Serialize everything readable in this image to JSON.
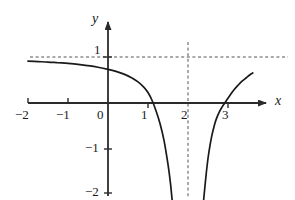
{
  "chart_data": {
    "type": "line",
    "title": "",
    "subtitle": "",
    "xlabel": "x",
    "ylabel": "y",
    "xlim": [
      -2.2,
      3.65
    ],
    "ylim": [
      -2.25,
      1.3
    ],
    "grid": false,
    "legend": null,
    "xticks": [
      -2,
      -1,
      0,
      1,
      2,
      3
    ],
    "xtick_labels": [
      "−2",
      "−1",
      "0",
      "1",
      "2",
      "3"
    ],
    "yticks": [
      1,
      -1,
      -2
    ],
    "ytick_labels": [
      "1",
      "−1",
      "−2"
    ],
    "asymptotes": [
      {
        "name": "horizontal-asymptote",
        "orientation": "horizontal",
        "value": 1,
        "label": "y = 1",
        "style": "dashed"
      },
      {
        "name": "vertical-asymptote",
        "orientation": "vertical",
        "value": 2,
        "label": "x = 2",
        "style": "dashed"
      }
    ],
    "x_intercepts": [
      1.1,
      2.95
    ],
    "series": [
      {
        "name": "left-branch",
        "style": "solid",
        "color": "#1a1a1a",
        "points": [
          [
            -2.0,
            0.92
          ],
          [
            -1.75,
            0.91
          ],
          [
            -1.5,
            0.9
          ],
          [
            -1.25,
            0.885
          ],
          [
            -1.0,
            0.87
          ],
          [
            -0.75,
            0.85
          ],
          [
            -0.5,
            0.82
          ],
          [
            -0.25,
            0.785
          ],
          [
            0.0,
            0.74
          ],
          [
            0.2,
            0.695
          ],
          [
            0.4,
            0.635
          ],
          [
            0.6,
            0.55
          ],
          [
            0.75,
            0.465
          ],
          [
            0.9,
            0.345
          ],
          [
            1.0,
            0.23
          ],
          [
            1.1,
            0.06
          ],
          [
            1.2,
            -0.17
          ],
          [
            1.3,
            -0.45
          ],
          [
            1.4,
            -0.82
          ],
          [
            1.5,
            -1.35
          ],
          [
            1.56,
            -1.75
          ],
          [
            1.6,
            -2.1
          ],
          [
            1.62,
            -2.25
          ]
        ]
      },
      {
        "name": "right-branch",
        "style": "solid",
        "color": "#1a1a1a",
        "points": [
          [
            2.38,
            -2.25
          ],
          [
            2.4,
            -2.05
          ],
          [
            2.45,
            -1.6
          ],
          [
            2.5,
            -1.22
          ],
          [
            2.55,
            -0.93
          ],
          [
            2.6,
            -0.7
          ],
          [
            2.65,
            -0.52
          ],
          [
            2.7,
            -0.37
          ],
          [
            2.78,
            -0.2
          ],
          [
            2.85,
            -0.09
          ],
          [
            2.95,
            0.04
          ],
          [
            3.05,
            0.17
          ],
          [
            3.15,
            0.29
          ],
          [
            3.25,
            0.39
          ],
          [
            3.35,
            0.48
          ],
          [
            3.45,
            0.55
          ],
          [
            3.55,
            0.62
          ],
          [
            3.62,
            0.66
          ]
        ]
      }
    ],
    "axes": {
      "x_axis": {
        "arrow": true,
        "label": "x"
      },
      "y_axis": {
        "arrow": true,
        "label": "y"
      }
    }
  },
  "labels": {
    "x_axis_name": "x",
    "y_axis_name": "y",
    "x_tick_neg2": "−2",
    "x_tick_neg1": "−1",
    "x_tick_zero": "0",
    "x_tick_one": "1",
    "x_tick_two": "2",
    "x_tick_three": "3",
    "y_tick_one": "1",
    "y_tick_neg1": "−1",
    "y_tick_neg2": "−2"
  },
  "colors": {
    "curve": "#1a1a1a",
    "axis": "#2b2b2b",
    "asymptote": "#555555",
    "background": "#ffffff",
    "text": "#1a1a1a"
  }
}
